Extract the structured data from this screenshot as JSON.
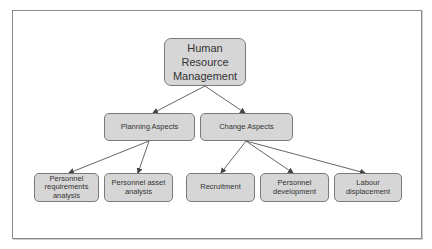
{
  "diagram": {
    "type": "hierarchy",
    "root": {
      "id": "hrm",
      "label_lines": [
        "Human",
        "Resource",
        "Management"
      ]
    },
    "level1": [
      {
        "id": "planning",
        "label": "Planning Aspects"
      },
      {
        "id": "change",
        "label": "Change Aspects"
      }
    ],
    "level2": [
      {
        "id": "pra",
        "parent": "planning",
        "label_lines": [
          "Personnel",
          "requirements",
          "analysis"
        ]
      },
      {
        "id": "paa",
        "parent": "planning",
        "label_lines": [
          "Personnel asset",
          "analysis"
        ]
      },
      {
        "id": "rec",
        "parent": "change",
        "label_lines": [
          "Recruitment"
        ]
      },
      {
        "id": "pdev",
        "parent": "change",
        "label_lines": [
          "Personnel",
          "development"
        ]
      },
      {
        "id": "ldis",
        "parent": "change",
        "label_lines": [
          "Labour",
          "displacement"
        ]
      }
    ],
    "edges": [
      [
        "hrm",
        "planning"
      ],
      [
        "hrm",
        "change"
      ],
      [
        "planning",
        "pra"
      ],
      [
        "planning",
        "paa"
      ],
      [
        "change",
        "rec"
      ],
      [
        "change",
        "pdev"
      ],
      [
        "change",
        "ldis"
      ]
    ],
    "colors": {
      "node_fill": "#d6d6d6",
      "node_border": "#7a7a7a",
      "edge": "#444444",
      "frame": "#8a8a8a"
    }
  }
}
